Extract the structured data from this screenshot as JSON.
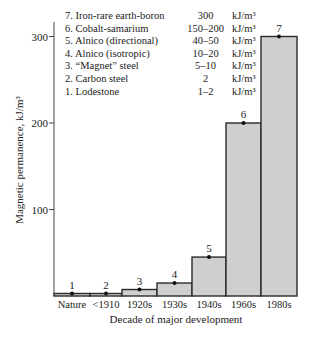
{
  "chart_data": {
    "type": "bar",
    "title": "",
    "xlabel": "Decade of major development",
    "ylabel": "Magnetic permanence, kJ/m³",
    "ylim": [
      0,
      320
    ],
    "yticks": [
      100,
      200,
      300
    ],
    "grid": false,
    "categories": [
      "Nature",
      "<1910",
      "1920s",
      "1930s",
      "1940s",
      "1960s",
      "1980s"
    ],
    "bar_numbers": [
      "1",
      "2",
      "3",
      "4",
      "5",
      "6",
      "7"
    ],
    "values": [
      1.5,
      2,
      7.5,
      15,
      45,
      200,
      300
    ],
    "legend_position": "top-inside",
    "legend": [
      {
        "label": "7. Iron-rare earth-boron",
        "range": "300",
        "unit": "kJ/m³"
      },
      {
        "label": "6. Cobalt-samarium",
        "range": "150–200",
        "unit": "kJ/m³"
      },
      {
        "label": "5. Alnico (directional)",
        "range": "40–50",
        "unit": "kJ/m³"
      },
      {
        "label": "4. Alnico (isotropic)",
        "range": "10–20",
        "unit": "kJ/m³"
      },
      {
        "label": "3. “Magnet” steel",
        "range": "5–10",
        "unit": "kJ/m³"
      },
      {
        "label": "2. Carbon steel",
        "range": "2",
        "unit": "kJ/m³"
      },
      {
        "label": "1. Lodestone",
        "range": "1–2",
        "unit": "kJ/m³"
      }
    ],
    "colors": {
      "bar_fill": "#cfcfcf",
      "bar_stroke": "#2a2a2a",
      "axis": "#444444"
    }
  }
}
